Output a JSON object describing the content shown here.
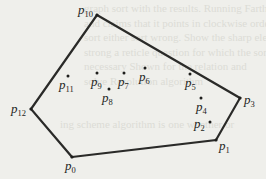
{
  "diagram": {
    "type": "convex-hull",
    "colors": {
      "ink": "#1e1e1c",
      "edge": "#2a2a28",
      "paper": "#efefeb",
      "bleed": "#dcdcd6"
    },
    "hull_order": [
      "p0",
      "p1",
      "p3",
      "p10",
      "p12"
    ],
    "points": [
      {
        "id": "p0",
        "base": "p",
        "sub": "0",
        "hull": true
      },
      {
        "id": "p1",
        "base": "p",
        "sub": "1",
        "hull": true
      },
      {
        "id": "p2",
        "base": "p",
        "sub": "2",
        "hull": false
      },
      {
        "id": "p3",
        "base": "p",
        "sub": "3",
        "hull": true
      },
      {
        "id": "p4",
        "base": "p",
        "sub": "4",
        "hull": false
      },
      {
        "id": "p5",
        "base": "p",
        "sub": "5",
        "hull": false
      },
      {
        "id": "p6",
        "base": "p",
        "sub": "6",
        "hull": false
      },
      {
        "id": "p7",
        "base": "p",
        "sub": "7",
        "hull": false
      },
      {
        "id": "p8",
        "base": "p",
        "sub": "8",
        "hull": false
      },
      {
        "id": "p9",
        "base": "p",
        "sub": "9",
        "hull": false
      },
      {
        "id": "p10",
        "base": "p",
        "sub": "10",
        "hull": true
      },
      {
        "id": "p11",
        "base": "p",
        "sub": "11",
        "hull": false
      },
      {
        "id": "p12",
        "base": "p",
        "sub": "12",
        "hull": true
      }
    ]
  },
  "bleed_text": [
    "graph sort with the results. Running Farthest",
    "and claims that it points in clockwise order. Left",
    "sort either sort wrong. Show the sharp element",
    "strong a reticle question for which the sort and",
    "necessary Shown for the relation and",
    "solve Resolution algorithm",
    "",
    "",
    "ing scheme algorithm is one whether or"
  ]
}
